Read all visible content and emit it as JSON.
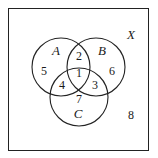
{
  "diagram": {
    "type": "venn",
    "universe_label": "X",
    "sets": [
      {
        "name": "A",
        "cx": 61,
        "cy": 67,
        "r": 29,
        "label_x": 56,
        "label_y": 55
      },
      {
        "name": "B",
        "cx": 96,
        "cy": 67,
        "r": 29,
        "label_x": 102,
        "label_y": 55
      },
      {
        "name": "C",
        "cx": 79,
        "cy": 97,
        "r": 29,
        "label_x": 78,
        "label_y": 118
      }
    ],
    "regions": [
      {
        "value": "1",
        "desc": "A∩B∩C",
        "x": 79,
        "y": 77
      },
      {
        "value": "2",
        "desc": "A∩B only",
        "x": 79,
        "y": 60
      },
      {
        "value": "3",
        "desc": "B∩C only",
        "x": 94,
        "y": 89
      },
      {
        "value": "4",
        "desc": "A∩C only",
        "x": 62,
        "y": 89
      },
      {
        "value": "5",
        "desc": "A only",
        "x": 44,
        "y": 75
      },
      {
        "value": "6",
        "desc": "B only",
        "x": 111,
        "y": 75
      },
      {
        "value": "7",
        "desc": "C only",
        "x": 79,
        "y": 103
      },
      {
        "value": "8",
        "desc": "outside A∪B∪C",
        "x": 131,
        "y": 119
      }
    ],
    "universe_label_pos": {
      "x": 131,
      "y": 39
    }
  }
}
